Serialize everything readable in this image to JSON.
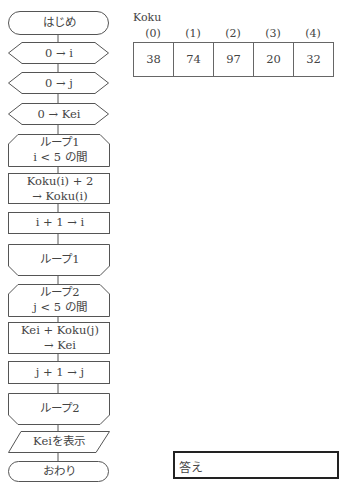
{
  "flowchart": {
    "start": "はじめ",
    "init_i": "0 → i",
    "init_j": "0 → j",
    "init_kei": "0 → Kei",
    "loop1_start": {
      "name": "ループ1",
      "condition": "i < 5 の間"
    },
    "loop1_body": {
      "line1": "Koku(i) + 2",
      "line2": "→ Koku(i)"
    },
    "loop1_increment": "i + 1 → i",
    "loop1_end": "ループ1",
    "loop2_start": {
      "name": "ループ2",
      "condition": "j < 5 の間"
    },
    "loop2_body": {
      "line1": "Kei + Koku(j)",
      "line2": "→ Kei"
    },
    "loop2_increment": "j + 1 → j",
    "loop2_end": "ループ2",
    "output": "Keiを表示",
    "end": "おわり"
  },
  "array": {
    "name": "Koku",
    "indices": [
      "(0)",
      "(1)",
      "(2)",
      "(3)",
      "(4)"
    ],
    "values": [
      "38",
      "74",
      "97",
      "20",
      "32"
    ]
  },
  "answer": {
    "label": "答え",
    "value": ""
  }
}
